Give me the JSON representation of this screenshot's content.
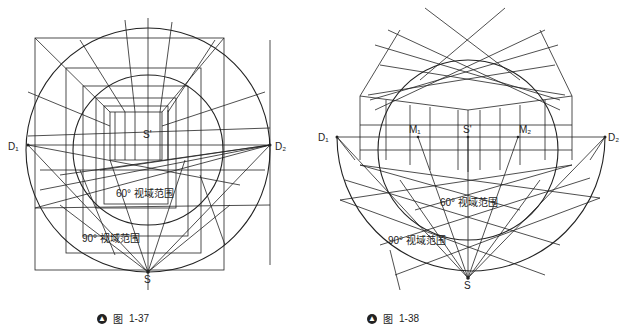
{
  "figures": [
    {
      "id": "fig-1-37",
      "caption": {
        "prefix": "图",
        "number": "1-37"
      },
      "labels": {
        "d1": "D₁",
        "d2": "D₂",
        "s_prime": "S'",
        "s": "S",
        "fov60": "60° 视域范围",
        "fov90": "90° 视域范围"
      }
    },
    {
      "id": "fig-1-38",
      "caption": {
        "prefix": "图",
        "number": "1-38"
      },
      "labels": {
        "d1": "D₁",
        "d2": "D₂",
        "m1": "M₁",
        "m2": "M₂",
        "s_prime": "S'",
        "s": "S",
        "fov60": "60° 视域范围",
        "fov90": "90° 视域范围"
      }
    }
  ],
  "colors": {
    "line": "#222222",
    "background": "#ffffff"
  }
}
